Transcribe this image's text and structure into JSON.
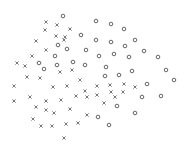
{
  "chart_data": {
    "type": "scatter",
    "title": "",
    "xlabel": "",
    "ylabel": "",
    "grid": false,
    "axes_visible": false,
    "legend": null,
    "xlim": [
      0,
      187
    ],
    "ylim": [
      146,
      0
    ],
    "colors": {
      "marker": "#555555",
      "background": "#ffffff"
    },
    "series": [
      {
        "name": "class-x",
        "marker": "x",
        "points": [
          [
            46,
            22
          ],
          [
            57,
            25
          ],
          [
            45,
            30
          ],
          [
            70,
            29
          ],
          [
            56,
            36
          ],
          [
            65,
            37
          ],
          [
            36,
            41
          ],
          [
            64,
            40
          ],
          [
            46,
            50
          ],
          [
            32,
            56
          ],
          [
            17,
            63
          ],
          [
            25,
            66
          ],
          [
            60,
            72
          ],
          [
            72,
            70
          ],
          [
            27,
            77
          ],
          [
            40,
            78
          ],
          [
            14,
            86
          ],
          [
            53,
            87
          ],
          [
            67,
            86
          ],
          [
            80,
            80
          ],
          [
            85,
            91
          ],
          [
            14,
            101
          ],
          [
            30,
            97
          ],
          [
            46,
            101
          ],
          [
            61,
            100
          ],
          [
            76,
            96
          ],
          [
            87,
            97
          ],
          [
            36,
            107
          ],
          [
            46,
            110
          ],
          [
            54,
            113
          ],
          [
            70,
            109
          ],
          [
            87,
            115
          ],
          [
            33,
            119
          ],
          [
            41,
            126
          ],
          [
            52,
            126
          ],
          [
            66,
            124
          ],
          [
            78,
            123
          ],
          [
            64,
            138
          ],
          [
            97,
            86
          ],
          [
            110,
            85
          ],
          [
            124,
            84
          ],
          [
            135,
            87
          ],
          [
            97,
            95
          ],
          [
            111,
            92
          ],
          [
            115,
            97
          ],
          [
            123,
            92
          ],
          [
            104,
            103
          ]
        ]
      },
      {
        "name": "class-o",
        "marker": "o",
        "points": [
          [
            63,
            16
          ],
          [
            81,
            35
          ],
          [
            58,
            45
          ],
          [
            67,
            49
          ],
          [
            86,
            50
          ],
          [
            55,
            56
          ],
          [
            39,
            63
          ],
          [
            44,
            69
          ],
          [
            57,
            65
          ],
          [
            73,
            62
          ],
          [
            85,
            65
          ],
          [
            96,
            21
          ],
          [
            111,
            24
          ],
          [
            124,
            29
          ],
          [
            96,
            40
          ],
          [
            111,
            42
          ],
          [
            125,
            46
          ],
          [
            135,
            40
          ],
          [
            99,
            56
          ],
          [
            114,
            54
          ],
          [
            129,
            57
          ],
          [
            144,
            51
          ],
          [
            158,
            57
          ],
          [
            106,
            67
          ],
          [
            132,
            71
          ],
          [
            166,
            70
          ],
          [
            105,
            76
          ],
          [
            119,
            75
          ],
          [
            147,
            84
          ],
          [
            174,
            80
          ],
          [
            142,
            97
          ],
          [
            161,
            96
          ],
          [
            117,
            106
          ],
          [
            135,
            113
          ],
          [
            98,
            117
          ],
          [
            109,
            125
          ]
        ]
      }
    ]
  }
}
